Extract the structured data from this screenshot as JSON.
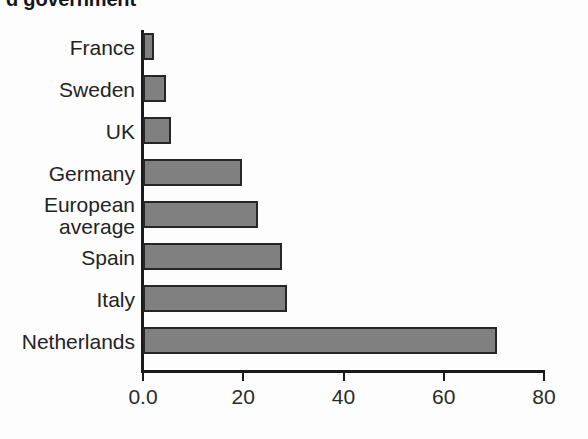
{
  "title": {
    "text": "d government",
    "note_clipped": true
  },
  "chart_data": {
    "type": "bar",
    "orientation": "horizontal",
    "title": "d government",
    "xlabel": "",
    "ylabel": "",
    "categories": [
      "France",
      "Sweden",
      "UK",
      "Germany",
      "European average",
      "Spain",
      "Italy",
      "Netherlands"
    ],
    "values": [
      2.2,
      4.6,
      5.6,
      19.8,
      23.0,
      27.7,
      28.8,
      70.6
    ],
    "xlim": [
      0,
      80
    ],
    "xticks": [
      0,
      20,
      40,
      60,
      80
    ],
    "xticklabels": [
      "0.0",
      "20",
      "40",
      "60",
      "80"
    ],
    "grid": false,
    "legend": false,
    "bar_color": "#808080",
    "bar_edge_color": "#262626",
    "background_color": "#fdfdfd",
    "axis_color": "#1a1a1a"
  },
  "categories_display": [
    {
      "line1": "France",
      "line2": ""
    },
    {
      "line1": "Sweden",
      "line2": ""
    },
    {
      "line1": "UK",
      "line2": ""
    },
    {
      "line1": "Germany",
      "line2": ""
    },
    {
      "line1": "European",
      "line2": "average"
    },
    {
      "line1": "Spain",
      "line2": ""
    },
    {
      "line1": "Italy",
      "line2": ""
    },
    {
      "line1": "Netherlands",
      "line2": ""
    }
  ],
  "axis": {
    "tick_labels": [
      "0.0",
      "20",
      "40",
      "60",
      "80"
    ]
  }
}
